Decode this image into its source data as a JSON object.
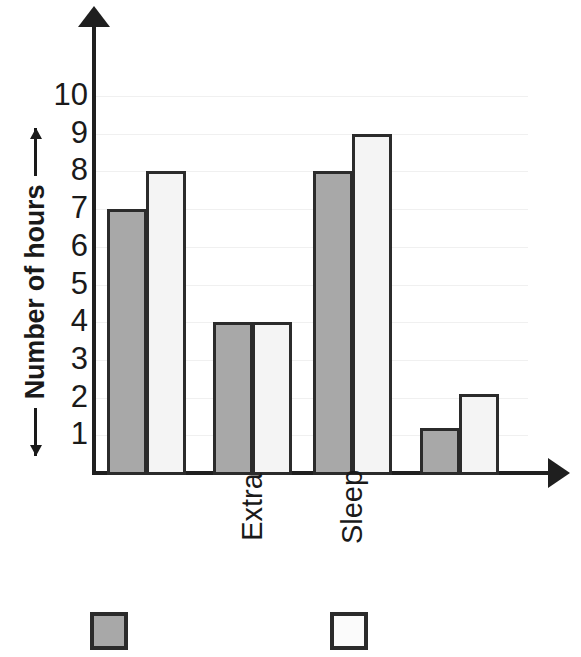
{
  "chart_data": {
    "type": "bar",
    "title": "",
    "xlabel": "",
    "ylabel": "Number of hours",
    "ylim": [
      0,
      10
    ],
    "yticks": [
      1,
      2,
      3,
      4,
      5,
      6,
      7,
      8,
      9,
      10
    ],
    "grid": true,
    "legend_position": "bottom",
    "categories": [
      "",
      "Extra",
      "Sleep",
      ""
    ],
    "series": [
      {
        "name": "",
        "color": "#a8a8a8",
        "values": [
          7,
          4,
          8,
          1.2
        ]
      },
      {
        "name": "",
        "color": "#f4f4f4",
        "values": [
          8,
          4,
          9,
          2.1
        ]
      }
    ]
  },
  "axes": {
    "y_title": "Number of hours",
    "y_arrow_up": "arrow-up-glyph",
    "y_arrow_down": "arrow-down-glyph",
    "x_arrow_right": "arrow-right-glyph",
    "y_tick_labels": [
      "10",
      "9",
      "8",
      "7",
      "6",
      "5",
      "4",
      "3",
      "2",
      "1"
    ],
    "x_tick_labels": [
      "Extra",
      "Sleep"
    ]
  },
  "legend": {
    "items": [
      {
        "swatch": "legend-swatch-gray",
        "label": ""
      },
      {
        "swatch": "legend-swatch-white",
        "label": ""
      }
    ]
  },
  "colors": {
    "series_a_fill": "#a8a8a8",
    "series_b_fill": "#f4f4f4",
    "bar_outline": "#2b2b2b",
    "axis": "#1f1f1f",
    "gridline": "#f0f0f0",
    "background": "#ffffff"
  }
}
